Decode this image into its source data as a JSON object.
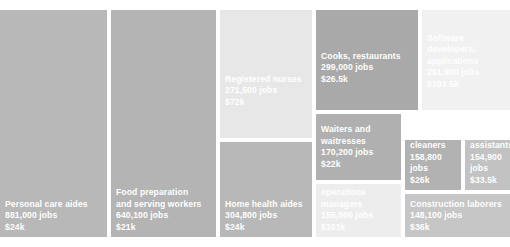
{
  "chart_data": {
    "type": "treemap",
    "title": "",
    "subtitle": "",
    "xlabel": "",
    "ylabel": "",
    "value_field": "jobs",
    "color_field": "median_annual_wage",
    "color_scale": {
      "type": "sequential-gray",
      "note": "lighter fill = higher median wage",
      "low_color": "#9a9a9a",
      "high_color": "#f2f2f2"
    },
    "legend": "none",
    "grid": false,
    "gap_color": "#ffffff",
    "nodes": [
      {
        "name": "Personal care aides",
        "jobs_label": "881,000 jobs",
        "wage_label": "$24k",
        "jobs": 881000,
        "wage": 24000,
        "color": "#b8b8b8",
        "rect": {
          "x": 0,
          "y": 10,
          "w": 107,
          "h": 227
        }
      },
      {
        "name": "Food preparation\nand serving workers",
        "jobs_label": "640,100 jobs",
        "wage_label": "$21k",
        "jobs": 640100,
        "wage": 21000,
        "color": "#b4b4b4",
        "rect": {
          "x": 111,
          "y": 10,
          "w": 105,
          "h": 227
        }
      },
      {
        "name": "Registered nurses",
        "jobs_label": "271,500 jobs",
        "wage_label": "$72k",
        "jobs": 271500,
        "wage": 72000,
        "color": "#e7e7e7",
        "rect": {
          "x": 220,
          "y": 10,
          "w": 92,
          "h": 128
        }
      },
      {
        "name": "Home health aides",
        "jobs_label": "304,800 jobs",
        "wage_label": "$24k",
        "jobs": 304800,
        "wage": 24000,
        "color": "#b8b8b8",
        "rect": {
          "x": 220,
          "y": 142,
          "w": 92,
          "h": 95
        }
      },
      {
        "name": "Cooks, restaurants",
        "jobs_label": "299,000 jobs",
        "wage_label": "$26.5k",
        "jobs": 299000,
        "wage": 26500,
        "color": "#a9a9a9",
        "rect": {
          "x": 316,
          "y": 10,
          "w": 102,
          "h": 100
        }
      },
      {
        "name": "Software developers,\napplications",
        "jobs_label": "261,900 jobs",
        "wage_label": "$103.5k",
        "jobs": 261900,
        "wage": 103500,
        "color": "#f1f1f1",
        "rect": {
          "x": 422,
          "y": 10,
          "w": 88,
          "h": 100
        }
      },
      {
        "name": "Waiters and\nwaitresses",
        "jobs_label": "170,200 jobs",
        "wage_label": "$22k",
        "jobs": 170200,
        "wage": 22000,
        "color": "#b0b0b0",
        "rect": {
          "x": 316,
          "y": 114,
          "w": 85,
          "h": 66
        }
      },
      {
        "name": "General and\noperations\nmanagers",
        "jobs_label": "155,000 jobs",
        "wage_label": "$101k",
        "jobs": 155000,
        "wage": 101000,
        "color": "#ededed",
        "rect": {
          "x": 316,
          "y": 184,
          "w": 85,
          "h": 53
        }
      },
      {
        "name": "Janitors and\ncleaners",
        "jobs_label": "158,800 jobs",
        "wage_label": "$26k",
        "jobs": 158800,
        "wage": 26000,
        "color": "#b2b2b2",
        "rect": {
          "x": 405,
          "y": 140,
          "w": 56,
          "h": 50
        }
      },
      {
        "name": "Medical\nassistants",
        "jobs_label": "154,900 jobs",
        "wage_label": "$33.5k",
        "jobs": 154900,
        "wage": 33500,
        "color": "#c2c2c2",
        "rect": {
          "x": 465,
          "y": 140,
          "w": 45,
          "h": 50
        }
      },
      {
        "name": "Construction laborers",
        "jobs_label": "148,100 jobs",
        "wage_label": "$36k",
        "jobs": 148100,
        "wage": 36000,
        "color": "#c6c6c6",
        "rect": {
          "x": 405,
          "y": 194,
          "w": 105,
          "h": 43
        }
      }
    ]
  }
}
